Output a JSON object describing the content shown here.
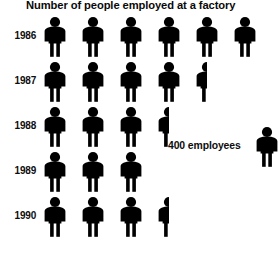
{
  "chart_data": {
    "type": "pictogram",
    "title": "Number of people employed at a factory",
    "xlabel": "",
    "ylabel": "",
    "categories": [
      "1986",
      "1987",
      "1988",
      "1989",
      "1990"
    ],
    "icon_unit_value": 400,
    "icon_unit_label": "400 employees",
    "icon_semantic": "person-icon",
    "icons_per_category": [
      6,
      4.5,
      3.5,
      3,
      3.5
    ],
    "values": [
      2400,
      1800,
      1400,
      1200,
      1400
    ],
    "legend": {
      "position": "right",
      "entries": [
        {
          "label": "400 employees",
          "icon": "person-icon"
        }
      ]
    },
    "grid": false,
    "colors": {
      "icon": "#000000",
      "text": "#000000",
      "background": "#ffffff"
    },
    "rows": [
      {
        "label": "1986",
        "full_icons": 6,
        "partial_icon": 0,
        "icons": 6,
        "value": 2400
      },
      {
        "label": "1987",
        "full_icons": 4,
        "partial_icon": 0.5,
        "icons": 4.5,
        "value": 1800
      },
      {
        "label": "1988",
        "full_icons": 3,
        "partial_icon": 0.5,
        "icons": 3.5,
        "value": 1400
      },
      {
        "label": "1989",
        "full_icons": 3,
        "partial_icon": 0,
        "icons": 3,
        "value": 1200
      },
      {
        "label": "1990",
        "full_icons": 3,
        "partial_icon": 0.5,
        "icons": 3.5,
        "value": 1400
      }
    ]
  },
  "chart": {
    "title": "Number of people employed at a factory",
    "legend_label": "400 employees"
  }
}
